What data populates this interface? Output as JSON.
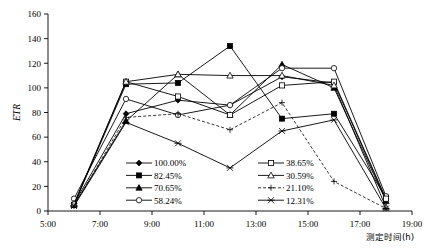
{
  "chart_data": {
    "type": "line",
    "title": "",
    "xlabel": "测定时间(h)",
    "ylabel": "ETR",
    "x": [
      6,
      8,
      10,
      12,
      14,
      16,
      18
    ],
    "xtick_labels": [
      "5:00",
      "7:00",
      "9:00",
      "11:00",
      "13:00",
      "15:00",
      "17:00",
      "19:00"
    ],
    "xtick_values": [
      5,
      7,
      9,
      11,
      13,
      15,
      17,
      19
    ],
    "xlim": [
      5,
      19
    ],
    "ylim": [
      0,
      160
    ],
    "ytick_values": [
      0,
      20,
      40,
      60,
      80,
      100,
      120,
      140,
      160
    ],
    "ytick_labels": [
      "0",
      "20",
      "40",
      "60",
      "80",
      "100",
      "120",
      "140",
      "160"
    ],
    "grid": false,
    "legend_position": "inside-bottom-center",
    "series": [
      {
        "name": "100.00%",
        "marker": "filled-diamond",
        "dash": false,
        "values": [
          6,
          79,
          90,
          86,
          109,
          104,
          9
        ]
      },
      {
        "name": "82.45%",
        "marker": "filled-square",
        "dash": false,
        "values": [
          5,
          103,
          104,
          134,
          75,
          79,
          11
        ]
      },
      {
        "name": "70.65%",
        "marker": "filled-triangle",
        "dash": false,
        "values": [
          5,
          73,
          111,
          78,
          119,
          100,
          8
        ]
      },
      {
        "name": "58.24%",
        "marker": "open-circle",
        "dash": false,
        "values": [
          10,
          91,
          78,
          86,
          116,
          116,
          12
        ]
      },
      {
        "name": "38.65%",
        "marker": "open-square",
        "dash": false,
        "values": [
          5,
          105,
          93,
          78,
          102,
          105,
          10
        ]
      },
      {
        "name": "30.59%",
        "marker": "open-triangle",
        "dash": false,
        "values": [
          6,
          105,
          111,
          110,
          110,
          102,
          3
        ]
      },
      {
        "name": "21.10%",
        "marker": "plus",
        "dash": true,
        "values": [
          4,
          76,
          79,
          66,
          88,
          24,
          2
        ]
      },
      {
        "name": "12.31%",
        "marker": "cross",
        "dash": false,
        "values": [
          4,
          72,
          55,
          35,
          65,
          74,
          2
        ]
      }
    ]
  },
  "legend": {
    "entries": [
      {
        "label": "100.00%"
      },
      {
        "label": "82.45%"
      },
      {
        "label": "70.65%"
      },
      {
        "label": "58.24%"
      },
      {
        "label": "38.65%"
      },
      {
        "label": "30.59%"
      },
      {
        "label": "21.10%"
      },
      {
        "label": "12.31%"
      }
    ]
  },
  "colors": {
    "line": "#000000",
    "axis": "#000000",
    "background": "#ffffff"
  }
}
